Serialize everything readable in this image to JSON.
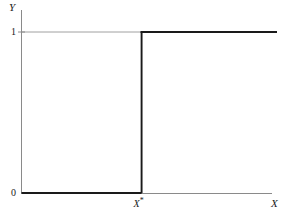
{
  "chart_data": {
    "type": "line",
    "title": "",
    "subtitle": "",
    "xlabel": "X",
    "ylabel": "Y",
    "xlim": [
      0,
      1
    ],
    "ylim": [
      0,
      1
    ],
    "grid": false,
    "legend": false,
    "legend_position": "none",
    "y_ticks": [
      "0",
      "1"
    ],
    "y_tick_values": [
      0,
      1
    ],
    "x_ticks": [
      "X*"
    ],
    "x_tick_values": [
      0.47
    ],
    "annotations": [
      "X*"
    ],
    "series": [
      {
        "name": "step function",
        "x": [
          0,
          0.47,
          0.47,
          1
        ],
        "values": [
          0,
          0,
          1,
          1
        ],
        "color": "#1a1a1a",
        "step": true
      }
    ]
  },
  "figure": {
    "axis": {
      "y_label": "Y",
      "x_label": "X"
    },
    "ticks": {
      "y_one": "1",
      "y_zero": "0",
      "x_star_base": "X",
      "x_star_sup": "*"
    },
    "colors": {
      "curve": "#1a1a1a",
      "axis": "#8a8a8a",
      "background": "#ffffff"
    }
  }
}
